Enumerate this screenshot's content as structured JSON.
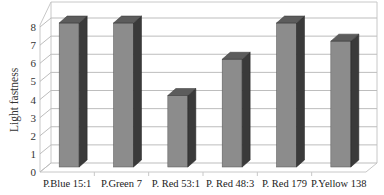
{
  "chart_data": {
    "type": "bar",
    "style": "3d-column",
    "title": "",
    "xlabel": "",
    "ylabel": "Light fastness",
    "ylim": [
      0,
      8
    ],
    "yticks": [
      0,
      1,
      2,
      3,
      4,
      5,
      6,
      7,
      8
    ],
    "grid": true,
    "legend": null,
    "categories": [
      "P.Blue 15:1",
      "P.Green 7",
      "P. Red 53:1",
      "P. Red 48:3",
      "P. Red 179",
      "P.Yellow 138"
    ],
    "values": [
      8,
      8,
      4,
      6,
      8,
      7
    ]
  },
  "colors": {
    "bar_front": "#8c8c8c",
    "bar_side": "#3a3a3a",
    "bar_top": "#5c5c5c",
    "grid": "#bdbdbd",
    "frame": "#c8c8c8"
  }
}
